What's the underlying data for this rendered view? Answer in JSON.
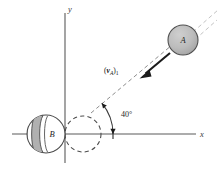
{
  "figure": {
    "background_color": "#ffffff",
    "width": 219,
    "height": 171
  },
  "axes": {
    "x_label": "x",
    "y_label": "y",
    "x_axis": {
      "x1": 12,
      "y1": 134,
      "x2": 196,
      "y2": 134
    },
    "y_axis": {
      "x1": 65,
      "y1": 13,
      "x2": 65,
      "y2": 163
    },
    "x_label_pos": {
      "x": 200,
      "y": 134
    },
    "y_label_pos": {
      "x": 68,
      "y": 11
    },
    "tick": {
      "x": 113,
      "y1": 129,
      "y2": 139
    },
    "stroke_color": "#5a5a5a"
  },
  "bodies": [
    {
      "name": "sphere-a",
      "label": "A",
      "cx": 183,
      "cy": 40,
      "r": 15,
      "fill": "#b4b4b4",
      "stroke": "#4f4f4f",
      "label_pos": {
        "x": 183,
        "y": 43
      }
    },
    {
      "name": "sphere-b",
      "label": "B",
      "cx": 46,
      "cy": 134,
      "r": 19,
      "fill": "#ffffff",
      "stroke": "#4a4a4a",
      "band_fill": "#b0b0b0",
      "label_pos": {
        "x": 52,
        "y": 137
      }
    }
  ],
  "ghost_circle": {
    "name": "sphere-b-displaced-outline",
    "cx": 83,
    "cy": 134,
    "r": 18,
    "stroke": "#4a4a4a",
    "dash": "4.2 3.2"
  },
  "velocity": {
    "label_text": "(",
    "symbol": "v",
    "subscript": "A",
    "label_close": ")",
    "index": "1",
    "label_pos": {
      "x": 107,
      "y": 73
    },
    "arrow_start": {
      "x": 170,
      "y": 53
    },
    "arrow_end": {
      "x": 140,
      "y": 78
    },
    "color": "#1b1b1b"
  },
  "line_of_impact": {
    "name": "line-of-impact",
    "start": {
      "x": 65,
      "y": 134
    },
    "end": {
      "x": 216,
      "y": 8
    },
    "visible_dash_start": {
      "x": 91,
      "y": 113
    },
    "color": "#8d8d8d"
  },
  "angle": {
    "value": "40°",
    "label_pos": {
      "x": 121,
      "y": 116
    },
    "arc_radius": 42,
    "vertex": {
      "x": 65,
      "y": 134
    },
    "start_deg": 0,
    "end_deg": 40
  },
  "colors": {
    "sphere_a_fill": "#b4b4b4",
    "sphere_b_band": "#b0b0b0",
    "axis": "#5a5a5a",
    "dashed": "#8d8d8d",
    "arrow": "#1b1b1b",
    "text": "#1e1e1e"
  }
}
